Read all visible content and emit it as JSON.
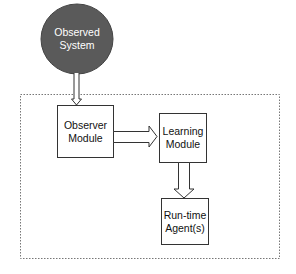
{
  "diagram": {
    "nodes": [
      {
        "id": "observed-system",
        "label_line1": "Observed",
        "label_line2": "System",
        "shape": "ellipse",
        "fill": "#5a5a5a",
        "text_color": "#ffffff"
      },
      {
        "id": "observer-module",
        "label_line1": "Observer",
        "label_line2": "Module",
        "shape": "rectangle",
        "fill": "#ffffff"
      },
      {
        "id": "learning-module",
        "label_line1": "Learning",
        "label_line2": "Module",
        "shape": "rectangle",
        "fill": "#ffffff"
      },
      {
        "id": "runtime-agents",
        "label_line1": "Run-time",
        "label_line2": "Agent(s)",
        "shape": "rectangle",
        "fill": "#ffffff"
      }
    ],
    "edges": [
      {
        "from": "observed-system",
        "to": "observer-module",
        "style": "hollow-arrow"
      },
      {
        "from": "observer-module",
        "to": "learning-module",
        "style": "hollow-arrow"
      },
      {
        "from": "learning-module",
        "to": "runtime-agents",
        "style": "hollow-arrow"
      }
    ],
    "boundary": {
      "style": "dotted",
      "contains": [
        "observer-module",
        "learning-module",
        "runtime-agents"
      ]
    },
    "colors": {
      "stroke": "#333333",
      "ellipse_fill": "#5a5a5a",
      "boundary": "#777777"
    }
  }
}
